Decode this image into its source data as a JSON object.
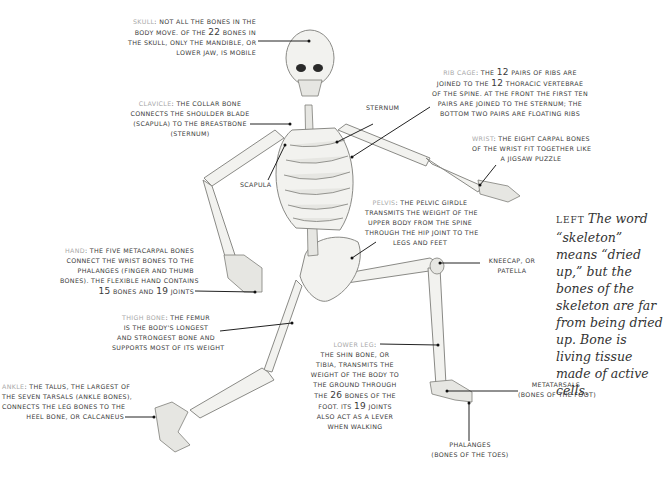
{
  "labels": {
    "skull": {
      "heading": "Skull",
      "sep": ":",
      "lines": [
        "not all the bones in the",
        "body move. Of the 22 bones in",
        "the skull, only the mandible, or",
        "lower jaw, is mobile"
      ]
    },
    "rib_cage": {
      "heading": "Rib cage",
      "sep": ":",
      "lines": [
        "the 12 pairs of ribs are",
        "joined to the 12 thoracic vertebrae",
        "of the spine. At the front the first ten",
        "pairs are joined to the sternum; the",
        "bottom two pairs are floating ribs"
      ]
    },
    "clavicle": {
      "heading": "Clavicle",
      "sep": ":",
      "lines": [
        "the collar bone",
        "connects the shoulder blade",
        "(scapula) to the breastbone",
        "(sternum)"
      ]
    },
    "sternum": {
      "text": "Sternum"
    },
    "scapula": {
      "text": "Scapula"
    },
    "wrist": {
      "heading": "Wrist",
      "sep": ":",
      "lines": [
        "the eight carpal bones",
        "of the wrist fit together like",
        "a jigsaw puzzle"
      ]
    },
    "pelvis": {
      "heading": "Pelvis",
      "sep": ":",
      "lines": [
        "the pelvic girdle",
        "transmits the weight of the",
        "upper body from the spine",
        "through the hip joint to the",
        "legs and feet"
      ]
    },
    "kneecap": {
      "lines": [
        "Kneecap, or",
        "patella"
      ]
    },
    "hand": {
      "heading": "Hand",
      "sep": ":",
      "lines": [
        "the five metacarpal bones",
        "connect the wrist bones to the",
        "phalanges (finger and thumb",
        "bones). The flexible hand contains",
        "15 bones and 19 joints"
      ]
    },
    "thigh_bone": {
      "heading": "Thigh bone",
      "sep": ":",
      "lines": [
        "the femur",
        "is the body's longest",
        "and strongest bone and",
        "supports most of its weight"
      ]
    },
    "ankle": {
      "heading": "Ankle",
      "sep": ":",
      "lines": [
        "the talus, the largest of",
        "the seven tarsals (ankle bones),",
        "connects the leg bones to the",
        "heel bone, or calcaneus"
      ]
    },
    "lower_leg": {
      "heading": "Lower leg",
      "sep": ":",
      "lines": [
        "the shin bone, or",
        "tibia, transmits the",
        "weight of the body to",
        "the ground through",
        "the 26 bones of the",
        "foot. Its 19 joints",
        "also act as a lever",
        "when walking"
      ]
    },
    "metatarsals": {
      "lines": [
        "Metatarsals",
        "(bones of the foot)"
      ]
    },
    "phalanges": {
      "lines": [
        "Phalanges",
        "(bones of the toes)"
      ]
    }
  },
  "caption": {
    "keyword": "Left",
    "text": "The word “skeleton” means “dried up,” but the bones of the skeleton are far from being dried up. Bone is living tissue made of active cells."
  }
}
